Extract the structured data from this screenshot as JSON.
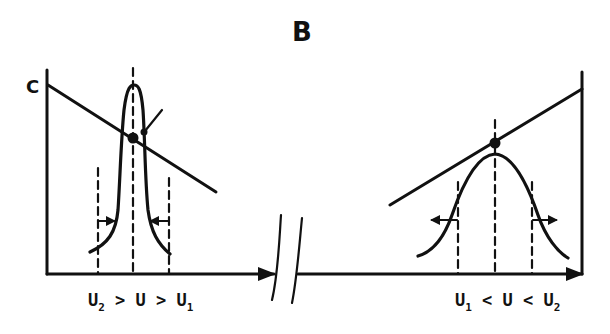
{
  "figure": {
    "title": "B",
    "y_axis_label": "C",
    "colors": {
      "ink": "#111111",
      "background": "#ffffff"
    }
  },
  "left_panel": {
    "condition": {
      "parts": [
        "U",
        "2",
        " > U > U",
        "1"
      ],
      "text": "U2 > U > U1"
    },
    "description": "Narrow peak; concentration line slopes downward; arrows on flanks point inward (peak narrows)",
    "line_slope": "decreasing",
    "flank_arrows": "inward"
  },
  "right_panel": {
    "condition": {
      "parts": [
        "U",
        "1",
        " < U < U",
        "2"
      ],
      "text": "U1 < U < U2"
    },
    "description": "Broad Gaussian peak; concentration line slopes upward; arrows on flanks point outward (peak broadens)",
    "line_slope": "increasing",
    "flank_arrows": "outward"
  },
  "axis_break": {
    "symbol": "//"
  }
}
